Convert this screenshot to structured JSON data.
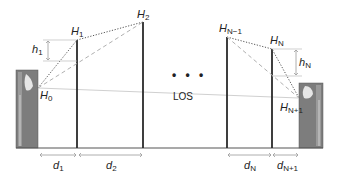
{
  "diagram": {
    "type": "multi-hop relay line-of-sight geometry",
    "nodes": [
      {
        "id": "H0",
        "label": "H",
        "sub": "0",
        "kind": "antenna-left"
      },
      {
        "id": "H1",
        "label": "H",
        "sub": "1",
        "kind": "relay-mast"
      },
      {
        "id": "H2",
        "label": "H",
        "sub": "2",
        "kind": "relay-mast"
      },
      {
        "id": "HN-1",
        "label": "H",
        "sub": "N−1",
        "kind": "relay-mast"
      },
      {
        "id": "HN",
        "label": "H",
        "sub": "N",
        "kind": "relay-mast"
      },
      {
        "id": "HN+1",
        "label": "H",
        "sub": "N+1",
        "kind": "antenna-right"
      }
    ],
    "heights": [
      {
        "id": "h1",
        "label": "h",
        "sub": "1"
      },
      {
        "id": "hN",
        "label": "h",
        "sub": "N"
      }
    ],
    "distances": [
      {
        "id": "d1",
        "label": "d",
        "sub": "1"
      },
      {
        "id": "d2",
        "label": "d",
        "sub": "2"
      },
      {
        "id": "dN",
        "label": "d",
        "sub": "N"
      },
      {
        "id": "dN+1",
        "label": "d",
        "sub": "N+1"
      }
    ],
    "ellipsis": "• • •",
    "los_label": "LOS",
    "colors": {
      "mast": "#2a2a2a",
      "dotted": "#555555",
      "dashed": "#aaaaaa",
      "los": "#cccccc",
      "arrow": "#999999",
      "antenna_bg": "#7a7a7a"
    }
  }
}
